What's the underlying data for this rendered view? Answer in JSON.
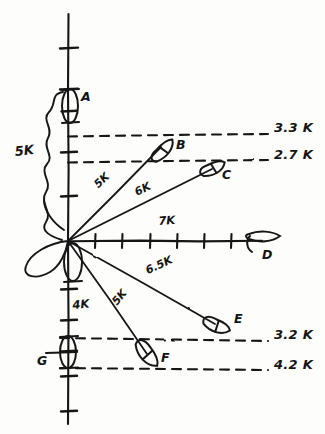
{
  "diagram": {
    "ink_color": "#161616",
    "paper_color": "#fdfdfb",
    "origin": {
      "x": 68,
      "y": 241
    },
    "axes": {
      "y_axis": {
        "x": 68,
        "y_top": 14,
        "y_bottom": 424
      },
      "x_axis": {
        "y": 241,
        "x_left": 68,
        "x_right": 262
      },
      "y_ticks_up": [
        196,
        152,
        111,
        89,
        48
      ],
      "y_ticks_down": [
        289,
        320,
        351,
        376,
        411
      ],
      "x_ticks": [
        95,
        122,
        150,
        177,
        204,
        231
      ]
    },
    "scale_brace": {
      "label": "5K",
      "label_x": 16,
      "label_y": 152,
      "top_y": 92,
      "bottom_y": 241
    },
    "axis_speed_labels": [
      {
        "name": "x-axis-speed",
        "text": "7K",
        "x": 161,
        "y": 223,
        "rotate": -4
      },
      {
        "name": "y-axis-down-speed",
        "text": "4K",
        "x": 68,
        "y": 307,
        "rotate": -5
      }
    ],
    "range_labels": [
      {
        "name": "range-label-b",
        "text": "3.3 K",
        "x": 274,
        "y": 128
      },
      {
        "name": "range-label-c",
        "text": "2.7 K",
        "x": 274,
        "y": 155
      },
      {
        "name": "range-label-e",
        "text": "3.2 K",
        "x": 274,
        "y": 334
      },
      {
        "name": "range-label-f",
        "text": "4.2 K",
        "x": 274,
        "y": 364
      }
    ],
    "dashed_lines": [
      {
        "name": "dashed-line-3-3k",
        "x1": 68,
        "y1": 136,
        "x2": 268,
        "y2": 134
      },
      {
        "name": "dashed-line-2-7k",
        "x1": 68,
        "y1": 162,
        "x2": 268,
        "y2": 160
      },
      {
        "name": "dashed-line-3-2k",
        "x1": 60,
        "y1": 338,
        "x2": 268,
        "y2": 341
      },
      {
        "name": "dashed-line-4-2k",
        "x1": 60,
        "y1": 368,
        "x2": 268,
        "y2": 370
      }
    ],
    "vectors": [
      {
        "name": "vector-to-b",
        "x1": 68,
        "y1": 241,
        "x2": 161,
        "y2": 146,
        "speed": "5K",
        "label_x": 97,
        "label_y": 190,
        "rotate": -44
      },
      {
        "name": "vector-to-c",
        "x1": 68,
        "y1": 241,
        "x2": 213,
        "y2": 167,
        "speed": "6K",
        "label_x": 137,
        "label_y": 196,
        "rotate": -27
      },
      {
        "name": "vector-to-e",
        "x1": 68,
        "y1": 241,
        "x2": 216,
        "y2": 324,
        "speed": "6.5K",
        "label_x": 147,
        "label_y": 276,
        "rotate": 24
      },
      {
        "name": "vector-to-f",
        "x1": 68,
        "y1": 241,
        "x2": 148,
        "y2": 356,
        "speed": "5K",
        "label_x": 114,
        "label_y": 309,
        "rotate": 50
      }
    ],
    "vessels": [
      {
        "id": "A",
        "name": "vessel-a",
        "cx": 70,
        "cy": 106,
        "rx": 8,
        "ry": 17,
        "rotate": 0,
        "label_x": 82,
        "label_y": 98,
        "style": "ellipse"
      },
      {
        "id": "B",
        "name": "vessel-b",
        "cx": 163,
        "cy": 150,
        "rx": 6,
        "ry": 13,
        "rotate": 40,
        "label_x": 176,
        "label_y": 145,
        "style": "ship"
      },
      {
        "id": "C",
        "name": "vessel-c",
        "cx": 213,
        "cy": 168,
        "rx": 6,
        "ry": 13,
        "rotate": 63,
        "label_x": 223,
        "label_y": 174,
        "style": "ship"
      },
      {
        "id": "D",
        "name": "vessel-d",
        "cx": 262,
        "cy": 240,
        "rx": 7,
        "ry": 14,
        "rotate": 90,
        "label_x": 265,
        "label_y": 250,
        "style": "ship"
      },
      {
        "id": "E",
        "name": "vessel-e",
        "cx": 217,
        "cy": 325,
        "rx": 6,
        "ry": 13,
        "rotate": 112,
        "label_x": 234,
        "label_y": 318,
        "style": "ship"
      },
      {
        "id": "F",
        "name": "vessel-f",
        "cx": 148,
        "cy": 354,
        "rx": 7,
        "ry": 14,
        "rotate": 140,
        "label_x": 162,
        "label_y": 357,
        "style": "ship"
      },
      {
        "id": "G",
        "name": "vessel-g",
        "cx": 68,
        "cy": 352,
        "rx": 8,
        "ry": 16,
        "rotate": 0,
        "label_x": 40,
        "label_y": 362,
        "style": "ellipse-bar"
      }
    ],
    "own_ship": {
      "name": "own-ship-symbol",
      "cx": 68,
      "cy": 241
    }
  }
}
